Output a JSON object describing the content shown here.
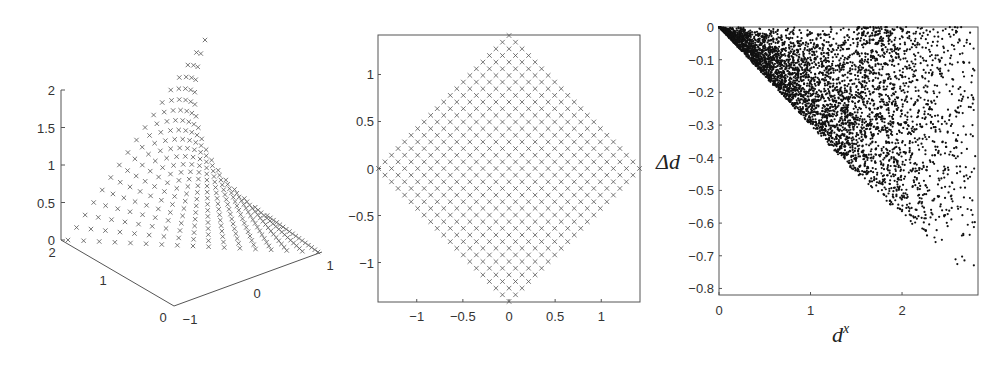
{
  "chart_data": [
    {
      "type": "scatter",
      "subtype": "3d",
      "title": "",
      "marker": "x",
      "axes": {
        "z_ticks": [
          "0",
          "0.5",
          "1",
          "1.5",
          "2"
        ],
        "depth_ticks": [
          "0",
          "1",
          "2"
        ],
        "width_ticks": [
          "-1",
          "0",
          "1"
        ],
        "zlim": [
          0,
          2
        ],
        "xlim": [
          -1,
          1
        ],
        "ylim": [
          0,
          2
        ]
      },
      "description": "Saddle-like curved surface of x markers rising from the base plane to z≈2.5"
    },
    {
      "type": "scatter",
      "title": "",
      "marker": "x",
      "xlabel": "",
      "ylabel": "",
      "x_ticks": [
        "-1",
        "-0.5",
        "0",
        "0.5",
        "1"
      ],
      "y_ticks": [
        "-1",
        "-0.5",
        "0",
        "0.5",
        "1"
      ],
      "xlim": [
        -1.42,
        1.42
      ],
      "ylim": [
        -1.42,
        1.42
      ],
      "description": "Diamond-shaped (rotated square) lattice of x markers with vertices at (0,±1.41) and (±1.41,0)"
    },
    {
      "type": "scatter",
      "title": "",
      "marker": "dot",
      "xlabel": "d^x",
      "ylabel": "Δd",
      "x_ticks": [
        "0",
        "1",
        "2"
      ],
      "y_ticks": [
        "0",
        "-0.1",
        "-0.2",
        "-0.3",
        "-0.4",
        "-0.5",
        "-0.6",
        "-0.7",
        "-0.8"
      ],
      "xlim": [
        0,
        2.83
      ],
      "ylim": [
        -0.82,
        0
      ],
      "description": "Dense dot cloud in wedge: upper boundary Δd=0, lower boundary from (0,0) to ~(1.5,-0.45), sparse tail to (2.8,-0.78)"
    }
  ],
  "labels": {
    "delta_d": "Δd",
    "d_x_base": "d",
    "d_x_sup": "x"
  }
}
